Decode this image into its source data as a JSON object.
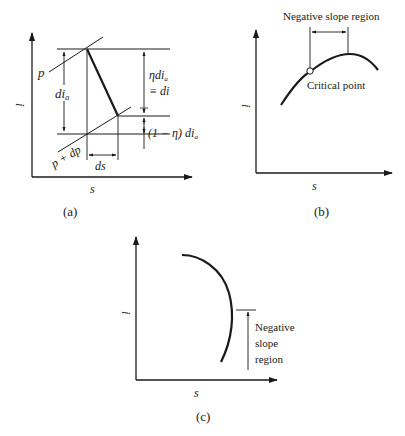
{
  "figure": {
    "panels": [
      {
        "id": "a",
        "caption": "(a)",
        "x_axis_label": "s",
        "y_axis_label": "i",
        "labels": {
          "isobar_p": "p",
          "isobar_p_dp": "p + dp",
          "dia": "di",
          "dia_sub": "a",
          "eta_dia": "ηdi",
          "eta_dia_sub": "a",
          "equiv_di": "≡ di",
          "one_minus_eta": "(1 − η) di",
          "one_minus_eta_sub": "a",
          "ds": "ds"
        }
      },
      {
        "id": "b",
        "caption": "(b)",
        "x_axis_label": "s",
        "y_axis_label": "i",
        "labels": {
          "region": "Negative slope region",
          "critical_point": "Critical point"
        }
      },
      {
        "id": "c",
        "caption": "(c)",
        "x_axis_label": "s",
        "y_axis_label": "i",
        "labels": {
          "region_line1": "Negative",
          "region_line2": "slope",
          "region_line3": "region"
        }
      }
    ],
    "colors": {
      "ink": "#1a1a1a",
      "background": "#ffffff"
    }
  }
}
